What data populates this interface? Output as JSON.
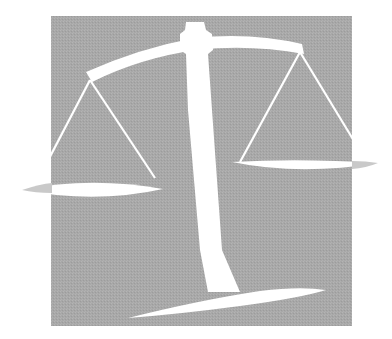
{
  "image": {
    "subject": "scales of justice",
    "alt": "Balance scale illustration on a gray square, tilted with the left pan lower"
  },
  "colors": {
    "background": "#ffffff",
    "panel": "#a9a9a9",
    "figure": "#ffffff",
    "shadow": "#bdbdbd"
  }
}
